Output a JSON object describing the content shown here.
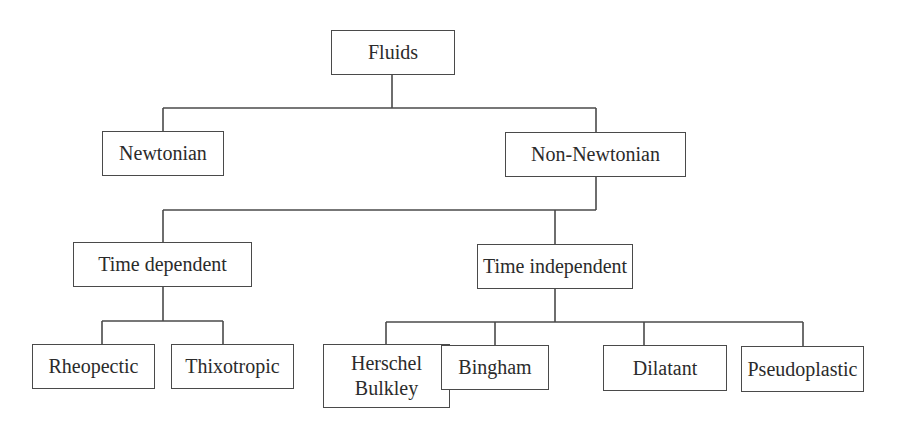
{
  "diagram": {
    "type": "hierarchy-tree",
    "nodes": [
      {
        "id": "fluids",
        "label": "Fluids",
        "parent": null
      },
      {
        "id": "newtonian",
        "label": "Newtonian",
        "parent": "fluids"
      },
      {
        "id": "non_newtonian",
        "label": "Non-Newtonian",
        "parent": "fluids"
      },
      {
        "id": "time_dependent",
        "label": "Time dependent",
        "parent": "non_newtonian"
      },
      {
        "id": "time_independent",
        "label": "Time independent",
        "parent": "non_newtonian"
      },
      {
        "id": "rheopectic",
        "label": "Rheopectic",
        "parent": "time_dependent"
      },
      {
        "id": "thixotropic",
        "label": "Thixotropic",
        "parent": "time_dependent"
      },
      {
        "id": "herschel_bulkley",
        "label": "Herschel\nBulkley",
        "parent": "time_independent"
      },
      {
        "id": "bingham",
        "label": "Bingham",
        "parent": "time_independent"
      },
      {
        "id": "dilatant",
        "label": "Dilatant",
        "parent": "time_independent"
      },
      {
        "id": "pseudoplastic",
        "label": "Pseudoplastic",
        "parent": "time_independent"
      }
    ]
  },
  "labels": {
    "fluids": "Fluids",
    "newtonian": "Newtonian",
    "non_newtonian": "Non-Newtonian",
    "time_dependent": "Time dependent",
    "time_independent": "Time independent",
    "rheopectic": "Rheopectic",
    "thixotropic": "Thixotropic",
    "herschel_bulkley": "Herschel\nBulkley",
    "bingham": "Bingham",
    "dilatant": "Dilatant",
    "pseudoplastic": "Pseudoplastic"
  },
  "colors": {
    "line": "#4a4a4a",
    "text": "#2b2b2b",
    "background": "#ffffff"
  }
}
